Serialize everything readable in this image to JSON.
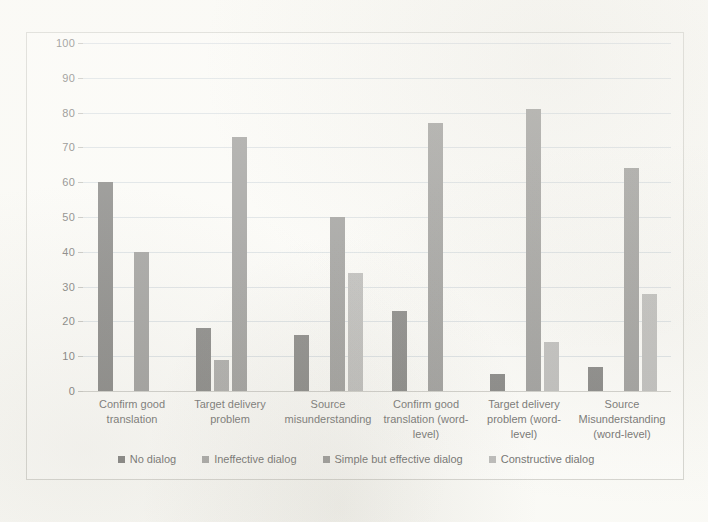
{
  "chart_data": {
    "type": "bar",
    "title": "",
    "xlabel": "",
    "ylabel": "",
    "ylim": [
      0,
      100
    ],
    "yticks": [
      100,
      90,
      80,
      70,
      60,
      50,
      40,
      30,
      20,
      10,
      0
    ],
    "grid": true,
    "legend_position": "bottom",
    "categories": [
      "Confirm good translation",
      "Target delivery problem",
      "Source misunderstanding",
      "Confirm good translation (word-level)",
      "Target delivery problem (word-level)",
      "Source Misunderstanding (word-level)"
    ],
    "series": [
      {
        "name": "No dialog",
        "color": "#595959",
        "values": [
          60,
          18,
          16,
          23,
          5,
          7
        ]
      },
      {
        "name": "Ineffective dialog",
        "color": "#8c8c8c",
        "values": [
          null,
          9,
          null,
          null,
          null,
          null
        ]
      },
      {
        "name": "Simple but effective dialog",
        "color": "#7a7a7a",
        "values": [
          40,
          73,
          50,
          77,
          81,
          64
        ]
      },
      {
        "name": "Constructive dialog",
        "color": "#a6a6a6",
        "values": [
          null,
          null,
          34,
          null,
          14,
          28
        ]
      }
    ]
  }
}
